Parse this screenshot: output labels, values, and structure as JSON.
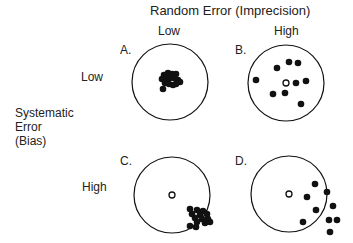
{
  "title": "Random Error (Imprecision)",
  "columns": [
    "Low",
    "High"
  ],
  "rows": [
    "Low",
    "High"
  ],
  "row_axis_label": [
    "Systematic",
    "Error",
    "(Bias)"
  ],
  "panels": [
    {
      "label": "A.",
      "random_error": "Low",
      "systematic_error": "Low",
      "center": [
        170,
        82
      ],
      "r": 38,
      "show_target_center": false,
      "dots": [
        [
          164,
          75
        ],
        [
          168,
          73
        ],
        [
          172,
          74
        ],
        [
          176,
          74
        ],
        [
          162,
          79
        ],
        [
          166,
          79
        ],
        [
          170,
          78
        ],
        [
          174,
          78
        ],
        [
          178,
          80
        ],
        [
          180,
          82
        ],
        [
          165,
          83
        ],
        [
          169,
          84
        ],
        [
          173,
          85
        ],
        [
          176,
          84
        ],
        [
          163,
          89
        ]
      ]
    },
    {
      "label": "B.",
      "random_error": "High",
      "systematic_error": "Low",
      "center": [
        286,
        83
      ],
      "r": 38,
      "show_target_center": true,
      "dots": [
        [
          289,
          62
        ],
        [
          298,
          63
        ],
        [
          277,
          68
        ],
        [
          256,
          80
        ],
        [
          296,
          83
        ],
        [
          306,
          81
        ],
        [
          273,
          94
        ],
        [
          285,
          93
        ],
        [
          301,
          104
        ]
      ]
    },
    {
      "label": "C.",
      "random_error": "Low",
      "systematic_error": "High",
      "center": [
        172,
        195
      ],
      "r": 38,
      "show_target_center": true,
      "dots": [
        [
          190,
          209
        ],
        [
          197,
          210
        ],
        [
          203,
          211
        ],
        [
          192,
          214
        ],
        [
          200,
          215
        ],
        [
          207,
          214
        ],
        [
          195,
          218
        ],
        [
          202,
          219
        ],
        [
          208,
          219
        ],
        [
          197,
          222
        ],
        [
          205,
          223
        ],
        [
          210,
          222
        ],
        [
          196,
          227
        ],
        [
          190,
          226
        ]
      ]
    },
    {
      "label": "D.",
      "random_error": "High",
      "systematic_error": "High",
      "center": [
        289,
        194
      ],
      "r": 38,
      "show_target_center": true,
      "dots": [
        [
          315,
          184
        ],
        [
          327,
          192
        ],
        [
          307,
          197
        ],
        [
          333,
          206
        ],
        [
          316,
          210
        ],
        [
          329,
          220
        ],
        [
          337,
          220
        ],
        [
          303,
          222
        ],
        [
          330,
          232
        ]
      ]
    }
  ],
  "colors": {
    "ink": "#111111",
    "text": "#222222",
    "background": "#ffffff"
  }
}
